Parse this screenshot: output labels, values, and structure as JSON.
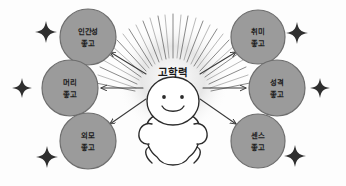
{
  "diagram": {
    "type": "radial-hub-and-spoke",
    "title_center": "고학력",
    "center": {
      "label": "고학력",
      "icon": "sunburst-icon",
      "figure": "smiling-person-icon",
      "cx": 173,
      "cy": 72
    },
    "colors": {
      "node_fill": "#9b9b9b",
      "node_stroke": "#6e6e6e",
      "text": "#1c1c1c",
      "arrow": "#3a3a3a",
      "sparkle": "#2f2f2f",
      "background": "#fdfdfd",
      "figure_fill": "#ffffff",
      "figure_stroke": "#2b2b2b"
    },
    "nodes": [
      {
        "id": "humanity",
        "line1": "인간성",
        "line2": "좋고",
        "cx": 88,
        "cy": 37,
        "r": 28
      },
      {
        "id": "hobby",
        "line1": "취미",
        "line2": "좋고",
        "cx": 258,
        "cy": 37,
        "r": 27
      },
      {
        "id": "brain",
        "line1": "머리",
        "line2": "좋고",
        "cx": 70,
        "cy": 88,
        "r": 28
      },
      {
        "id": "personality",
        "line1": "성격",
        "line2": "좋고",
        "cx": 277,
        "cy": 88,
        "r": 28
      },
      {
        "id": "appearance",
        "line1": "외모",
        "line2": "좋고",
        "cx": 88,
        "cy": 141,
        "r": 28
      },
      {
        "id": "sense",
        "line1": "센스",
        "line2": "좋고",
        "cx": 258,
        "cy": 141,
        "r": 27
      }
    ],
    "arrows": [
      {
        "id": "arrow-to-humanity",
        "from": "center",
        "to": "humanity"
      },
      {
        "id": "arrow-to-hobby",
        "from": "center",
        "to": "hobby"
      },
      {
        "id": "arrow-to-brain",
        "from": "center",
        "to": "brain"
      },
      {
        "id": "arrow-to-personality",
        "from": "center",
        "to": "personality"
      },
      {
        "id": "arrow-to-appearance",
        "from": "center",
        "to": "appearance"
      },
      {
        "id": "arrow-to-sense",
        "from": "center",
        "to": "sense"
      }
    ],
    "sparkles": [
      {
        "id": "sparkle-top-left",
        "cx": 46,
        "cy": 32,
        "size": 11
      },
      {
        "id": "sparkle-mid-left",
        "cx": 22,
        "cy": 88,
        "size": 10
      },
      {
        "id": "sparkle-bottom-left",
        "cx": 47,
        "cy": 157,
        "size": 11
      },
      {
        "id": "sparkle-top-right",
        "cx": 297,
        "cy": 33,
        "size": 11
      },
      {
        "id": "sparkle-mid-right",
        "cx": 320,
        "cy": 88,
        "size": 10
      },
      {
        "id": "sparkle-bottom-right",
        "cx": 295,
        "cy": 156,
        "size": 11
      }
    ]
  }
}
